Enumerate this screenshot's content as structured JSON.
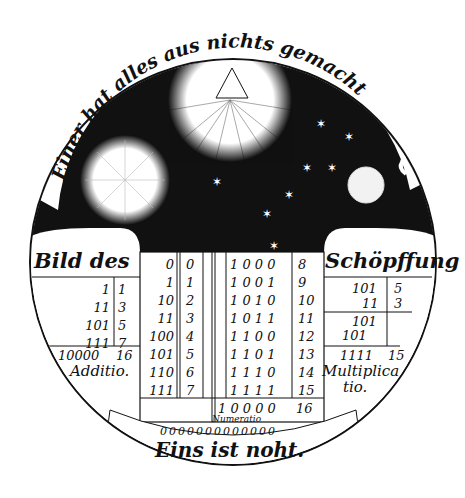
{
  "engraving": {
    "top_arc_inscription": "Einer hat alles aus nichts gemacht",
    "bottom_motto": "Eins ist noht.",
    "left_header": "Bild des",
    "right_header": "Schöpffung",
    "numeratio_label": "Numeratio",
    "zero_row": "0000000000000",
    "addition": {
      "rows": [
        {
          "binary": "1",
          "decimal": "1"
        },
        {
          "binary": "11",
          "decimal": "3"
        },
        {
          "binary": "101",
          "decimal": "5"
        },
        {
          "binary": "111",
          "decimal": "7"
        }
      ],
      "sum_binary": "10000",
      "sum_decimal": "16",
      "label": "Additio."
    },
    "multiplication": {
      "rows": [
        {
          "binary": "101",
          "decimal": "5"
        },
        {
          "binary": "11",
          "decimal": "3"
        }
      ],
      "partials": [
        "101",
        "101"
      ],
      "product_binary": "1111",
      "product_decimal": "15",
      "label_line1": "Multiplica",
      "label_line2": "tio."
    },
    "numeration_left": [
      {
        "binary": "0",
        "decimal": "0"
      },
      {
        "binary": "1",
        "decimal": "1"
      },
      {
        "binary": "10",
        "decimal": "2"
      },
      {
        "binary": "11",
        "decimal": "3"
      },
      {
        "binary": "100",
        "decimal": "4"
      },
      {
        "binary": "101",
        "decimal": "5"
      },
      {
        "binary": "110",
        "decimal": "6"
      },
      {
        "binary": "111",
        "decimal": "7"
      }
    ],
    "numeration_right": [
      {
        "binary": "1 0 0 0",
        "decimal": "8"
      },
      {
        "binary": "1 0 0 1",
        "decimal": "9"
      },
      {
        "binary": "1 0 1 0",
        "decimal": "10"
      },
      {
        "binary": "1 0 1 1",
        "decimal": "11"
      },
      {
        "binary": "1 1 0 0",
        "decimal": "12"
      },
      {
        "binary": "1 1 0 1",
        "decimal": "13"
      },
      {
        "binary": "1 1 1 0",
        "decimal": "14"
      },
      {
        "binary": "1 1 1 1",
        "decimal": "15"
      }
    ],
    "numeration_total": {
      "binary": "1 0 0 0 0",
      "decimal": "16"
    },
    "celestial": [
      "trinity-triangle-sun",
      "sun",
      "moon",
      "stars"
    ],
    "colors": {
      "ink": "#111111",
      "paper": "#ffffff"
    }
  }
}
